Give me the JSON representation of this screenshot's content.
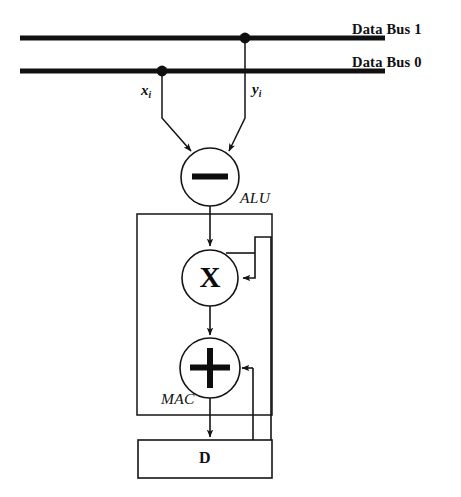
{
  "figure": {
    "background_color": "#ffffff",
    "line_color": "#1a1a1a",
    "bus_color": "#111111"
  },
  "buses": [
    {
      "id": "data-bus-1",
      "label": "Data Bus 1",
      "y": 38,
      "x_start": 20,
      "x_end": 385,
      "tap_x": 245,
      "tap_signal": "y_i"
    },
    {
      "id": "data-bus-0",
      "label": "Data Bus 0",
      "y": 71,
      "x_start": 20,
      "x_end": 385,
      "tap_x": 162,
      "tap_signal": "x_i"
    }
  ],
  "signals": [
    {
      "id": "x-signal",
      "base": "x",
      "sub": "i",
      "x": 142,
      "y": 86
    },
    {
      "id": "y-signal",
      "base": "y",
      "sub": "i",
      "x": 252,
      "y": 86
    }
  ],
  "operators": [
    {
      "id": "alu-operator",
      "glyph": "minus",
      "symbol": "−",
      "label": "ALU",
      "cx": 210,
      "cy": 177,
      "r": 29
    },
    {
      "id": "multiplier-operator",
      "glyph": "multiply",
      "symbol": "X",
      "label": "",
      "cx": 210,
      "cy": 278,
      "r": 28
    },
    {
      "id": "adder-operator",
      "glyph": "plus",
      "symbol": "+",
      "label": "MAC",
      "cx": 210,
      "cy": 368,
      "r": 30
    }
  ],
  "blocks": [
    {
      "id": "mac-block",
      "label": "MAC",
      "x": 137,
      "y": 214,
      "width": 135,
      "height": 201,
      "label_x": 162,
      "label_y": 393
    },
    {
      "id": "d-register",
      "label": "D",
      "x": 138,
      "y": 440,
      "width": 134,
      "height": 38
    }
  ],
  "labels": {
    "alu": "ALU",
    "mac": "MAC",
    "d_register": "D",
    "bus1": "Data Bus 1",
    "bus0": "Data Bus 0"
  },
  "connections": [
    {
      "id": "x-tap-to-alu",
      "from": "data-bus-0",
      "to": "alu-operator",
      "arrow": true
    },
    {
      "id": "y-tap-to-alu",
      "from": "data-bus-1",
      "to": "alu-operator",
      "arrow": true
    },
    {
      "id": "alu-to-multiplier",
      "from": "alu-operator",
      "to": "multiplier-operator",
      "arrow": true
    },
    {
      "id": "multiplier-to-adder",
      "from": "multiplier-operator",
      "to": "adder-operator",
      "arrow": true
    },
    {
      "id": "adder-to-d-register",
      "from": "adder-operator",
      "to": "d-register",
      "arrow": true
    },
    {
      "id": "feedback-to-multiplier",
      "from": "d-register",
      "to": "multiplier-operator",
      "arrow": true
    },
    {
      "id": "feedback-to-adder",
      "from": "d-register",
      "to": "adder-operator",
      "arrow": true
    }
  ]
}
